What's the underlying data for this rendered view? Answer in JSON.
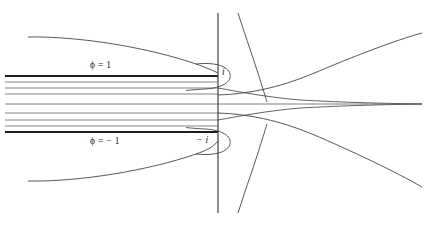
{
  "figure": {
    "background_color": "#ffffff",
    "line_color": "#2b2b2b",
    "thin_line_color": "#555555",
    "width": 426,
    "height": 226,
    "labels": [
      {
        "id": "phi-positive",
        "text": "ϕ = 1",
        "x": 90,
        "y": 66,
        "italic": false
      },
      {
        "id": "phi-negative",
        "text": "ϕ = − 1",
        "x": 90,
        "y": 142,
        "italic": false
      },
      {
        "id": "point-i",
        "text": "i",
        "x": 222,
        "y": 73,
        "italic": true
      },
      {
        "id": "point-minus-i",
        "text": "− i",
        "x": 196,
        "y": 141,
        "italic": true
      }
    ],
    "axis": {
      "name": "imaginary-axis",
      "x": 218,
      "y_top": 13,
      "y_bottom": 213,
      "stroke_width": 1.1
    },
    "plate_top": {
      "name": "upper-plate",
      "x_start": 5,
      "x_end": 218,
      "y": 76,
      "stroke_width": 1.9,
      "potential": "ϕ = 1"
    },
    "plate_bottom": {
      "name": "lower-plate",
      "x_start": 5,
      "x_end": 218,
      "y": 132,
      "stroke_width": 1.9,
      "potential": "ϕ = − 1"
    },
    "streamlines_between": {
      "name": "interior-streamlines",
      "count": 7,
      "x_start": 5,
      "x_end": 218,
      "y_values": [
        82,
        88,
        94,
        104,
        113,
        120,
        126
      ]
    },
    "center_line": {
      "name": "real-axis-streamline",
      "y": 104,
      "x_start": 5,
      "x_end": 422
    },
    "outer_curves": [
      {
        "name": "upper-outer-arc-left",
        "side": "top",
        "start": [
          28,
          37
        ],
        "end": [
          218,
          73
        ]
      },
      {
        "name": "lower-outer-arc-left",
        "side": "bottom",
        "start": [
          28,
          181
        ],
        "end": [
          218,
          141
        ]
      },
      {
        "name": "upper-outer-hyperbola-right",
        "side": "top",
        "start": [
          218,
          95
        ],
        "end": [
          422,
          33
        ]
      },
      {
        "name": "lower-outer-hyperbola-right",
        "side": "bottom",
        "start": [
          218,
          113
        ],
        "end": [
          422,
          187
        ]
      },
      {
        "name": "upper-vertical-arc",
        "side": "top",
        "start": [
          238,
          13
        ],
        "end": [
          268,
          100
        ]
      },
      {
        "name": "lower-vertical-arc",
        "side": "bottom",
        "start": [
          238,
          213
        ],
        "end": [
          268,
          110
        ]
      },
      {
        "name": "upper-tip-loop",
        "side": "top",
        "note": "small loop wrapping the point i"
      },
      {
        "name": "lower-tip-loop",
        "side": "bottom",
        "note": "small loop wrapping the point -i"
      }
    ]
  }
}
